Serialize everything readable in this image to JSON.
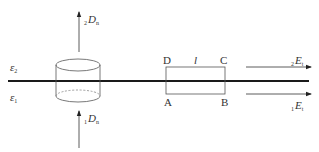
{
  "diagram": {
    "title": "",
    "interface": {
      "upper_medium": "ε",
      "upper_medium_sub": "2",
      "lower_medium": "ε",
      "lower_medium_sub": "1"
    },
    "left_figure": {
      "shape": "Gaussian pillbox cylinder",
      "top_vector": {
        "prefix": "2",
        "symbol": "D",
        "suffix": "n"
      },
      "bottom_vector": {
        "prefix": "1",
        "symbol": "D",
        "suffix": "n"
      }
    },
    "right_figure": {
      "shape": "rectangular loop",
      "corners": {
        "top_left": "D",
        "top_right": "C",
        "bottom_left": "A",
        "bottom_right": "B"
      },
      "length_label": "l",
      "upper_vector": {
        "prefix": "2",
        "symbol": "E",
        "suffix": "t"
      },
      "lower_vector": {
        "prefix": "1",
        "symbol": "E",
        "suffix": "t"
      }
    },
    "colors": {
      "line": "#1a1a1a",
      "thin": "#555555",
      "text": "#333333"
    }
  }
}
